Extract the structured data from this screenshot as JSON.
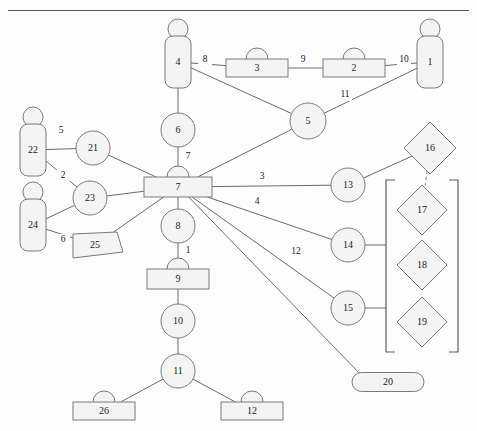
{
  "diagram": {
    "title": "",
    "shape_colors": {
      "fill": "#f4f4f4",
      "stroke": "#7a7a7a",
      "edge": "#6a6a6a"
    },
    "nodes": [
      {
        "id": "n1",
        "label": "1",
        "shape": "person",
        "x": 430,
        "y": 62,
        "w": 26,
        "h": 52
      },
      {
        "id": "n2",
        "label": "2",
        "shape": "bump-rect",
        "x": 354,
        "y": 68,
        "w": 62,
        "h": 18
      },
      {
        "id": "n3",
        "label": "3",
        "shape": "bump-rect",
        "x": 257,
        "y": 68,
        "w": 62,
        "h": 18
      },
      {
        "id": "n4",
        "label": "4",
        "shape": "person",
        "x": 178,
        "y": 62,
        "w": 26,
        "h": 52
      },
      {
        "id": "n5",
        "label": "5",
        "shape": "circle",
        "x": 308,
        "y": 121,
        "w": 36,
        "h": 36
      },
      {
        "id": "n6",
        "label": "6",
        "shape": "circle",
        "x": 178,
        "y": 130,
        "w": 34,
        "h": 34
      },
      {
        "id": "n7",
        "label": "7",
        "shape": "bump-rect",
        "x": 178,
        "y": 187,
        "w": 68,
        "h": 20
      },
      {
        "id": "n8",
        "label": "8",
        "shape": "circle",
        "x": 178,
        "y": 226,
        "w": 34,
        "h": 34
      },
      {
        "id": "n9",
        "label": "9",
        "shape": "bump-rect",
        "x": 178,
        "y": 279,
        "w": 62,
        "h": 20
      },
      {
        "id": "n10",
        "label": "10",
        "shape": "circle",
        "x": 178,
        "y": 321,
        "w": 34,
        "h": 34
      },
      {
        "id": "n11",
        "label": "11",
        "shape": "circle",
        "x": 178,
        "y": 371,
        "w": 34,
        "h": 34
      },
      {
        "id": "n12",
        "label": "12",
        "shape": "bump-rect",
        "x": 252,
        "y": 411,
        "w": 62,
        "h": 18
      },
      {
        "id": "n13",
        "label": "13",
        "shape": "circle",
        "x": 348,
        "y": 185,
        "w": 34,
        "h": 34
      },
      {
        "id": "n14",
        "label": "14",
        "shape": "circle",
        "x": 348,
        "y": 245,
        "w": 34,
        "h": 34
      },
      {
        "id": "n15",
        "label": "15",
        "shape": "circle",
        "x": 348,
        "y": 308,
        "w": 34,
        "h": 34
      },
      {
        "id": "n16",
        "label": "16",
        "shape": "diamond",
        "x": 430,
        "y": 148,
        "w": 52,
        "h": 52
      },
      {
        "id": "n17",
        "label": "17",
        "shape": "diamond",
        "x": 422,
        "y": 210,
        "w": 50,
        "h": 50
      },
      {
        "id": "n18",
        "label": "18",
        "shape": "diamond",
        "x": 422,
        "y": 265,
        "w": 50,
        "h": 50
      },
      {
        "id": "n19",
        "label": "19",
        "shape": "diamond",
        "x": 422,
        "y": 322,
        "w": 50,
        "h": 50
      },
      {
        "id": "n20",
        "label": "20",
        "shape": "stadium",
        "x": 388,
        "y": 382,
        "w": 72,
        "h": 19
      },
      {
        "id": "n21",
        "label": "21",
        "shape": "circle",
        "x": 93,
        "y": 148,
        "w": 34,
        "h": 34
      },
      {
        "id": "n22",
        "label": "22",
        "shape": "person",
        "x": 33,
        "y": 150,
        "w": 26,
        "h": 52
      },
      {
        "id": "n23",
        "label": "23",
        "shape": "circle",
        "x": 90,
        "y": 198,
        "w": 34,
        "h": 34
      },
      {
        "id": "n24",
        "label": "24",
        "shape": "person",
        "x": 33,
        "y": 225,
        "w": 26,
        "h": 52
      },
      {
        "id": "n25",
        "label": "25",
        "shape": "flag",
        "x": 95,
        "y": 245,
        "w": 44,
        "h": 26
      },
      {
        "id": "n26",
        "label": "26",
        "shape": "bump-rect",
        "x": 104,
        "y": 411,
        "w": 62,
        "h": 18
      }
    ],
    "edges": [
      {
        "from": "n4",
        "to": "n3",
        "label": "8",
        "lx": 205,
        "ly": 60,
        "style": "solid"
      },
      {
        "from": "n3",
        "to": "n2",
        "label": "9",
        "lx": 303,
        "ly": 60,
        "style": "solid"
      },
      {
        "from": "n2",
        "to": "n1",
        "label": "10",
        "lx": 404,
        "ly": 60,
        "style": "solid"
      },
      {
        "from": "n4",
        "to": "n5",
        "label": "",
        "lx": 0,
        "ly": 0,
        "style": "solid"
      },
      {
        "from": "n5",
        "to": "n1",
        "label": "11",
        "lx": 345,
        "ly": 95,
        "style": "solid"
      },
      {
        "from": "n5",
        "to": "n7",
        "label": "",
        "lx": 0,
        "ly": 0,
        "style": "solid"
      },
      {
        "from": "n4",
        "to": "n6",
        "label": "",
        "lx": 0,
        "ly": 0,
        "style": "solid"
      },
      {
        "from": "n6",
        "to": "n7",
        "label": "7",
        "lx": 188,
        "ly": 157,
        "style": "solid"
      },
      {
        "from": "n7",
        "to": "n8",
        "label": "",
        "lx": 0,
        "ly": 0,
        "style": "solid"
      },
      {
        "from": "n8",
        "to": "n9",
        "label": "1",
        "lx": 188,
        "ly": 251,
        "style": "solid"
      },
      {
        "from": "n9",
        "to": "n10",
        "label": "",
        "lx": 0,
        "ly": 0,
        "style": "solid"
      },
      {
        "from": "n10",
        "to": "n11",
        "label": "",
        "lx": 0,
        "ly": 0,
        "style": "solid"
      },
      {
        "from": "n11",
        "to": "n26",
        "label": "",
        "lx": 0,
        "ly": 0,
        "style": "solid"
      },
      {
        "from": "n11",
        "to": "n12",
        "label": "",
        "lx": 0,
        "ly": 0,
        "style": "solid"
      },
      {
        "from": "n7",
        "to": "n13",
        "label": "3",
        "lx": 262,
        "ly": 177,
        "style": "solid"
      },
      {
        "from": "n7",
        "to": "n14",
        "label": "4",
        "lx": 257,
        "ly": 202,
        "style": "solid"
      },
      {
        "from": "n7",
        "to": "n15",
        "label": "",
        "lx": 0,
        "ly": 0,
        "style": "solid"
      },
      {
        "from": "n7",
        "to": "n20",
        "label": "12",
        "lx": 296,
        "ly": 252,
        "style": "solid"
      },
      {
        "from": "n13",
        "to": "n16",
        "label": "",
        "lx": 0,
        "ly": 0,
        "style": "solid"
      },
      {
        "from": "n16",
        "to": "n17",
        "label": "",
        "lx": 0,
        "ly": 0,
        "style": "dashed"
      },
      {
        "from": "n14",
        "to": "bracket",
        "label": "",
        "lx": 0,
        "ly": 0,
        "style": "solid"
      },
      {
        "from": "n15",
        "to": "bracket",
        "label": "",
        "lx": 0,
        "ly": 0,
        "style": "solid"
      },
      {
        "from": "n22",
        "to": "n21",
        "label": "5",
        "lx": 61,
        "ly": 131,
        "style": "solid"
      },
      {
        "from": "n22",
        "to": "n23",
        "label": "2",
        "lx": 63,
        "ly": 176,
        "style": "solid"
      },
      {
        "from": "n24",
        "to": "n23",
        "label": "",
        "lx": 0,
        "ly": 0,
        "style": "solid"
      },
      {
        "from": "n24",
        "to": "n25",
        "label": "6",
        "lx": 63,
        "ly": 240,
        "style": "solid"
      },
      {
        "from": "n21",
        "to": "n7",
        "label": "",
        "lx": 0,
        "ly": 0,
        "style": "solid"
      },
      {
        "from": "n23",
        "to": "n7",
        "label": "",
        "lx": 0,
        "ly": 0,
        "style": "solid"
      },
      {
        "from": "n25",
        "to": "n7",
        "label": "",
        "lx": 0,
        "ly": 0,
        "style": "solid"
      }
    ],
    "bracket": {
      "x_left": 386,
      "x_right": 458,
      "y_top": 180,
      "y_bottom": 352,
      "tab": 9
    }
  }
}
